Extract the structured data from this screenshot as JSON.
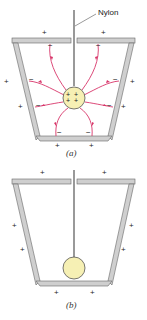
{
  "panels": [
    {
      "id": "a",
      "caption": "(a)",
      "label_nylon": "Nylon",
      "sphere_charge": "+ + + +",
      "outer_charge": "+",
      "inner_charge": "−",
      "field_lines": 8,
      "colors": {
        "field": "#d8366a",
        "wall": "#c8c8c8",
        "sphere": "#f6f0b4"
      }
    },
    {
      "id": "b",
      "caption": "(b)",
      "outer_charge": "+",
      "colors": {
        "wall": "#c8c8c8",
        "sphere": "#f6f0b4"
      }
    }
  ]
}
